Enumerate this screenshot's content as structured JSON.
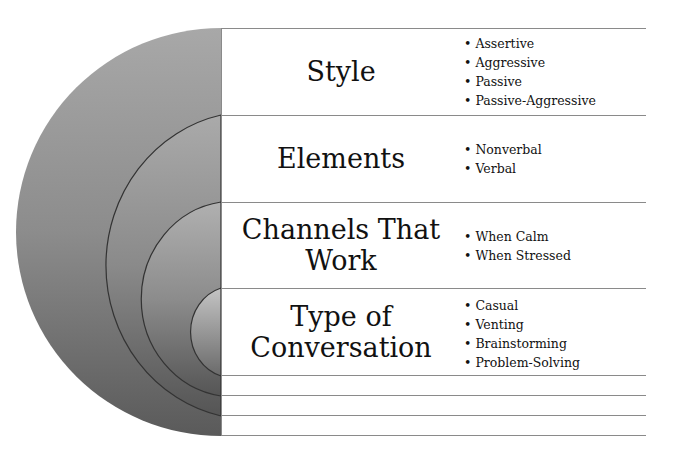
{
  "diagram": {
    "type": "concentric-semicircles-with-table",
    "rows": [
      {
        "label": "Style",
        "items": [
          "Assertive",
          "Aggressive",
          "Passive",
          "Passive-Aggressive"
        ]
      },
      {
        "label": "Elements",
        "items": [
          "Nonverbal",
          "Verbal"
        ]
      },
      {
        "label": "Channels That Work",
        "items": [
          "When Calm",
          "When Stressed"
        ]
      },
      {
        "label": "Type of Conversation",
        "items": [
          "Casual",
          "Venting",
          "Brainstorming",
          "Problem-Solving"
        ]
      }
    ],
    "empty_rows": 3,
    "colors": {
      "arc_outer": "#9a9a9a",
      "arc_dark": "#555555",
      "rule": "#8a8a8a",
      "text": "#111111"
    }
  }
}
